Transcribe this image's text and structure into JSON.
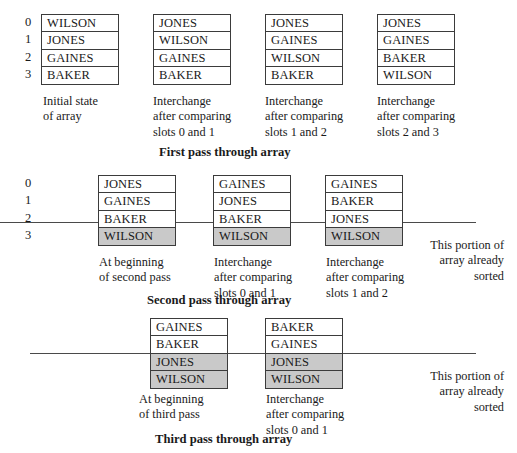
{
  "figure": {
    "title_first": "First pass through array",
    "title_second": "Second pass through array",
    "title_third": "Third pass through array",
    "sorted_note": "This portion of\narray already\nsorted",
    "indices": [
      "0",
      "1",
      "2",
      "3"
    ],
    "shade_color": "#c9c9c9",
    "border_color": "#3b3b3b"
  },
  "pass1": {
    "snapshots": [
      {
        "cells": [
          "WILSON",
          "JONES",
          "GAINES",
          "BAKER"
        ],
        "shaded": [
          false,
          false,
          false,
          false
        ],
        "caption": "Initial state\nof array"
      },
      {
        "cells": [
          "JONES",
          "WILSON",
          "GAINES",
          "BAKER"
        ],
        "shaded": [
          false,
          false,
          false,
          false
        ],
        "caption": "Interchange\nafter comparing\nslots 0 and 1"
      },
      {
        "cells": [
          "JONES",
          "GAINES",
          "WILSON",
          "BAKER"
        ],
        "shaded": [
          false,
          false,
          false,
          false
        ],
        "caption": "Interchange\nafter comparing\nslots 1 and 2"
      },
      {
        "cells": [
          "JONES",
          "GAINES",
          "BAKER",
          "WILSON"
        ],
        "shaded": [
          false,
          false,
          false,
          false
        ],
        "caption": "Interchange\nafter comparing\nslots 2 and 3"
      }
    ]
  },
  "pass2": {
    "snapshots": [
      {
        "cells": [
          "JONES",
          "GAINES",
          "BAKER",
          "WILSON"
        ],
        "shaded": [
          false,
          false,
          false,
          true
        ],
        "caption": "At beginning\nof second pass"
      },
      {
        "cells": [
          "GAINES",
          "JONES",
          "BAKER",
          "WILSON"
        ],
        "shaded": [
          false,
          false,
          false,
          true
        ],
        "caption": "Interchange\nafter comparing\nslots 0 and 1"
      },
      {
        "cells": [
          "GAINES",
          "BAKER",
          "JONES",
          "WILSON"
        ],
        "shaded": [
          false,
          false,
          false,
          true
        ],
        "caption": "Interchange\nafter comparing\nslots 1 and 2"
      }
    ]
  },
  "pass3": {
    "snapshots": [
      {
        "cells": [
          "GAINES",
          "BAKER",
          "JONES",
          "WILSON"
        ],
        "shaded": [
          false,
          false,
          true,
          true
        ],
        "caption": "At beginning\nof third pass"
      },
      {
        "cells": [
          "BAKER",
          "GAINES",
          "JONES",
          "WILSON"
        ],
        "shaded": [
          false,
          false,
          true,
          true
        ],
        "caption": "Interchange\nafter comparing\nslots 0 and 1"
      }
    ]
  }
}
